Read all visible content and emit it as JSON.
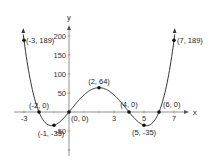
{
  "chart_data": {
    "type": "line",
    "title": "",
    "xlabel": "x",
    "ylabel": "y",
    "function": "y = x(x+2)(x-4)(x-6)",
    "xlim": [
      -3,
      7
    ],
    "ylim": [
      -100,
      210
    ],
    "grid": false,
    "x_ticks": [
      -3,
      3,
      5,
      7
    ],
    "x_tick_labels": [
      "-3",
      "3",
      "5",
      "7"
    ],
    "y_ticks": [
      200,
      150,
      100,
      50,
      -50
    ],
    "y_tick_labels": [
      "200",
      "150",
      "100",
      "50",
      "-50"
    ],
    "series": [
      {
        "name": "polynomial",
        "x": [
          -3,
          -2,
          -1,
          0,
          2,
          4,
          5,
          6,
          7
        ],
        "y": [
          189,
          0,
          -35,
          0,
          64,
          0,
          -35,
          0,
          189
        ]
      }
    ],
    "annotations": [
      {
        "x": -3,
        "y": 189,
        "text": "(-3, 189)"
      },
      {
        "x": -2,
        "y": 0,
        "text": "(-2, 0)"
      },
      {
        "x": -1,
        "y": -35,
        "text": "(-1, -35)"
      },
      {
        "x": 0,
        "y": 0,
        "text": "(0, 0)"
      },
      {
        "x": 2,
        "y": 64,
        "text": "(2, 64)"
      },
      {
        "x": 4,
        "y": 0,
        "text": "(4, 0)"
      },
      {
        "x": 5,
        "y": -35,
        "text": "(5, -35)"
      },
      {
        "x": 6,
        "y": 0,
        "text": "(6, 0)"
      },
      {
        "x": 7,
        "y": 189,
        "text": "(7, 189)"
      }
    ]
  },
  "axes": {
    "x_label": "x",
    "y_label": "y"
  },
  "style": {
    "curve_color": "#333333",
    "axis_color": "#666666",
    "point_color": "#111111"
  }
}
